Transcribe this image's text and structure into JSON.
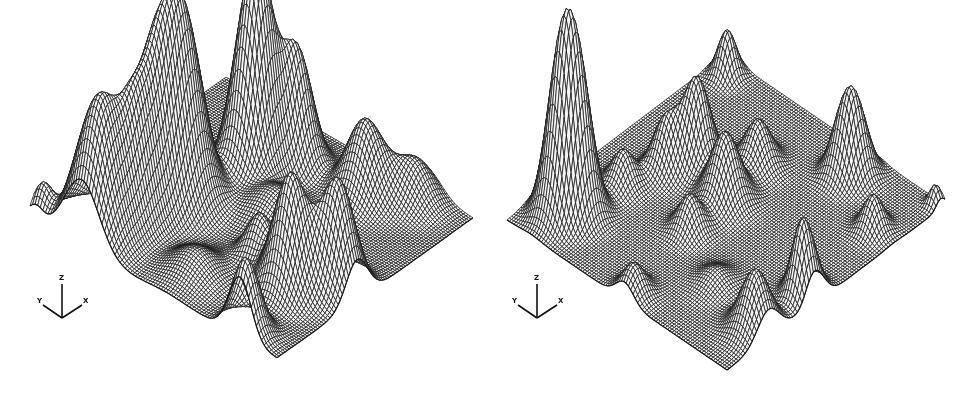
{
  "chart_data": [
    {
      "type": "surface3d",
      "title": "",
      "style": "wireframe mesh, isometric projection, hidden-line removal",
      "axes": {
        "x": "X",
        "y": "Y",
        "z": "Z"
      },
      "grid_on": false,
      "legend": null,
      "ink_color": "#1a1a1a",
      "fill_color": "#f4f4f4",
      "mesh_resolution": 96,
      "projection": {
        "back": [
          226,
          77
        ],
        "left": [
          30,
          217
        ],
        "right": [
          473,
          218
        ]
      },
      "peaks": [
        {
          "u": 0.586,
          "v": 0.29,
          "height": 178,
          "sigma": 0.065
        },
        {
          "u": 0.917,
          "v": 0.21,
          "height": 135,
          "sigma": 0.07
        },
        {
          "u": 0.34,
          "v": 0.358,
          "height": 135,
          "sigma": 0.055
        },
        {
          "u": 0.285,
          "v": 0.376,
          "height": 115,
          "sigma": 0.05
        },
        {
          "u": 0.188,
          "v": 0.437,
          "height": 113,
          "sigma": 0.05
        },
        {
          "u": 0.689,
          "v": 0.259,
          "height": 130,
          "sigma": 0.06
        },
        {
          "u": 0.794,
          "v": 0.261,
          "height": 95,
          "sigma": 0.055
        },
        {
          "u": 0.7,
          "v": 0.815,
          "height": 115,
          "sigma": 0.055
        },
        {
          "u": 0.592,
          "v": 0.923,
          "height": 110,
          "sigma": 0.055
        },
        {
          "u": 0.154,
          "v": 0.684,
          "height": 75,
          "sigma": 0.06
        },
        {
          "u": 0.06,
          "v": 0.813,
          "height": 40,
          "sigma": 0.06
        },
        {
          "u": 0.963,
          "v": 0.023,
          "height": 30,
          "sigma": 0.03
        },
        {
          "u": 0.97,
          "v": 0.85,
          "height": 75,
          "sigma": 0.045
        },
        {
          "u": 0.65,
          "v": 0.653,
          "height": 45,
          "sigma": 0.045
        },
        {
          "u": 0.45,
          "v": 0.55,
          "height": 30,
          "sigma": 0.08
        },
        {
          "u": 0.85,
          "v": 0.55,
          "height": 25,
          "sigma": 0.07
        }
      ],
      "axis_triad": {
        "x": 62,
        "y": 318,
        "labels": [
          "Y",
          "Z",
          "X"
        ]
      }
    },
    {
      "type": "surface3d",
      "title": "",
      "style": "wireframe mesh, isometric projection, hidden-line removal",
      "axes": {
        "x": "X",
        "y": "Y",
        "z": "Z"
      },
      "grid_on": false,
      "legend": null,
      "ink_color": "#1a1a1a",
      "fill_color": "#f4f4f4",
      "mesh_resolution": 96,
      "projection": {
        "back": [
          238,
          55
        ],
        "left": [
          20,
          220
        ],
        "right": [
          458,
          205
        ]
      },
      "peaks": [
        {
          "u": 0.059,
          "v": 0.068,
          "height": 45,
          "sigma": 0.03
        },
        {
          "u": 0.869,
          "v": 0.111,
          "height": 145,
          "sigma": 0.045
        },
        {
          "u": 0.826,
          "v": 0.158,
          "height": 120,
          "sigma": 0.045
        },
        {
          "u": 0.412,
          "v": 0.28,
          "height": 87,
          "sigma": 0.045
        },
        {
          "u": 0.497,
          "v": 0.22,
          "height": 50,
          "sigma": 0.04
        },
        {
          "u": 0.636,
          "v": 0.167,
          "height": 35,
          "sigma": 0.04
        },
        {
          "u": 0.463,
          "v": 0.458,
          "height": 68,
          "sigma": 0.05
        },
        {
          "u": 0.279,
          "v": 0.426,
          "height": 45,
          "sigma": 0.045
        },
        {
          "u": 0.634,
          "v": 0.469,
          "height": 35,
          "sigma": 0.04
        },
        {
          "u": 0.095,
          "v": 0.695,
          "height": 57,
          "sigma": 0.04
        },
        {
          "u": 0.128,
          "v": 0.659,
          "height": 50,
          "sigma": 0.04
        },
        {
          "u": 0.236,
          "v": 0.907,
          "height": 35,
          "sigma": 0.035
        },
        {
          "u": 0.59,
          "v": 0.95,
          "height": 60,
          "sigma": 0.04
        },
        {
          "u": 0.81,
          "v": 0.94,
          "height": 60,
          "sigma": 0.05
        },
        {
          "u": 0.96,
          "v": 0.535,
          "height": 30,
          "sigma": 0.04
        },
        {
          "u": 0.02,
          "v": 0.976,
          "height": 20,
          "sigma": 0.02
        },
        {
          "u": 0.618,
          "v": 0.953,
          "height": 25,
          "sigma": 0.03
        },
        {
          "u": 0.75,
          "v": 0.7,
          "height": 15,
          "sigma": 0.05
        }
      ],
      "axis_triad": {
        "x": 50,
        "y": 318,
        "labels": [
          "Y",
          "Z",
          "X"
        ]
      }
    }
  ]
}
